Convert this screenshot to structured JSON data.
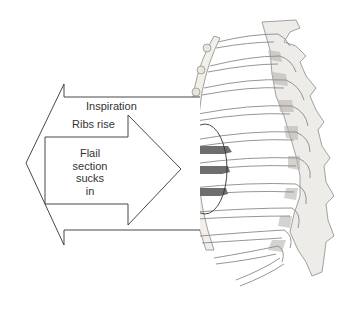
{
  "diagram": {
    "labels": {
      "inspiration": "Inspiration",
      "ribs_rise": "Ribs rise",
      "flail_line1": "Flail",
      "flail_line2": "section",
      "flail_line3": "sucks",
      "flail_line4": "in"
    },
    "arrows": [
      {
        "name": "outward-arrow",
        "direction": "left",
        "meaning": "Inspiration / Ribs rise"
      },
      {
        "name": "inward-arrow",
        "direction": "right",
        "meaning": "Flail section sucks in"
      }
    ],
    "highlight": {
      "shape": "ellipse",
      "encloses": "flail segment (3 fractured rib segments)"
    },
    "colors": {
      "outline": "#333333",
      "bone_fill": "#f4f2ee",
      "bone_stroke": "#8a8a8a",
      "flail_segment": "#6e6e6e",
      "background": "#ffffff"
    }
  }
}
